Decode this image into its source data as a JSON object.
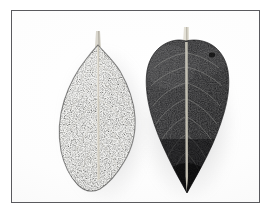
{
  "figure": {
    "kind": "photograph",
    "background_color": "#ffffff",
    "frame_color": "#5a5a5e",
    "caption": "",
    "title": ""
  },
  "specimens": [
    {
      "id": "left-leaf",
      "name": "speckled-leaf",
      "surface": "heavily speckled / stippled mottled surface",
      "tone": "medium gray with dense light flecks",
      "shape": "ovate-elliptic with rounded base",
      "midrib": "pale prominent midrib with short petiole at apex",
      "fill_color": "#6b6b6b",
      "speckle_color": "#efefef",
      "vein_color": "#dedad0"
    },
    {
      "id": "right-leaf",
      "name": "dark-veined-leaf",
      "surface": "smooth dark lamina with visible pinnate venation",
      "tone": "very dark gray to near black",
      "shape": "broad cordate top tapering to an acute point",
      "midrib": "pale narrow midrib running full length",
      "fill_color": "#262628",
      "speckle_color": "#3d3d40",
      "vein_color": "#8e8e8c"
    }
  ],
  "colors": {
    "plate": "#fdfdfd",
    "shadow": "#78787c",
    "frame": "#5a5a5e"
  }
}
